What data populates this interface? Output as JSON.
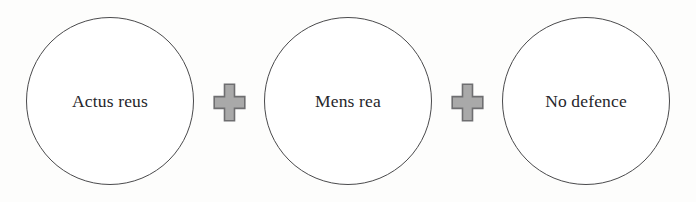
{
  "diagram": {
    "type": "criminal-liability-formula",
    "background_color": "#fdfdfc",
    "circle_outline_color": "#4a4a4c",
    "circle_fill_color": "#ffffff",
    "text_color": "#26262a",
    "operator_fill_color": "#a9a9a9",
    "operator_outline_color": "#6e6e70",
    "nodes": [
      {
        "label": "Actus reus",
        "icon": "circle-outline"
      },
      {
        "label": "Mens rea",
        "icon": "circle-outline"
      },
      {
        "label": "No defence",
        "icon": "circle-outline"
      }
    ],
    "operators": [
      {
        "symbol": "+",
        "icon": "plus-icon"
      },
      {
        "symbol": "+",
        "icon": "plus-icon"
      }
    ]
  }
}
